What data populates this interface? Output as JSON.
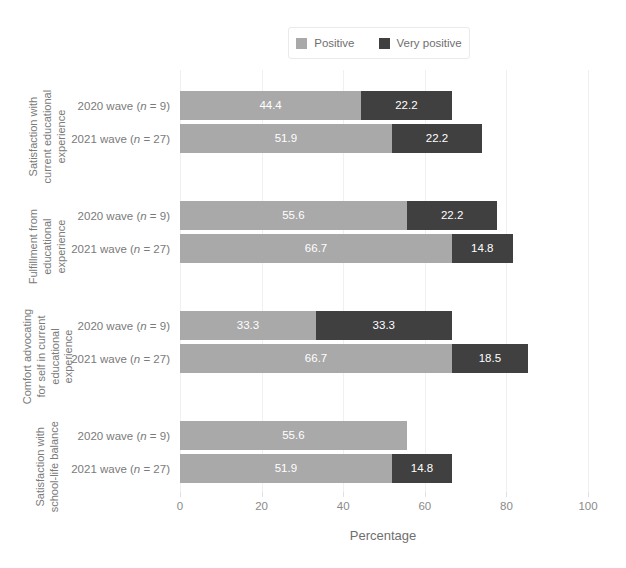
{
  "chart_data": {
    "type": "bar",
    "orientation": "horizontal",
    "stacked": true,
    "title": "",
    "xlabel": "Percentage",
    "ylabel": "",
    "xlim": [
      0,
      100
    ],
    "xticks": [
      0,
      20,
      40,
      60,
      80,
      100
    ],
    "grid": true,
    "legend_position": "top",
    "series": [
      {
        "name": "Positive",
        "color": "#a9a9a9"
      },
      {
        "name": "Very positive",
        "color": "#404040"
      }
    ],
    "groups": [
      {
        "label": "Satisfaction with current educational experience",
        "rows": [
          {
            "category": "2020 wave (n = 9)",
            "wave": "2020 wave",
            "n": 9,
            "values": [
              44.4,
              22.2
            ],
            "total": 66.6
          },
          {
            "category": "2021 wave (n = 27)",
            "wave": "2021 wave",
            "n": 27,
            "values": [
              51.9,
              22.2
            ],
            "total": 74.1
          }
        ]
      },
      {
        "label": "Fulfillment from educational experience",
        "rows": [
          {
            "category": "2020 wave (n = 9)",
            "wave": "2020 wave",
            "n": 9,
            "values": [
              55.6,
              22.2
            ],
            "total": 77.8
          },
          {
            "category": "2021 wave (n = 27)",
            "wave": "2021 wave",
            "n": 27,
            "values": [
              66.7,
              14.8
            ],
            "total": 81.5
          }
        ]
      },
      {
        "label": "Comfort advocating for self in current educational experience",
        "rows": [
          {
            "category": "2020 wave (n = 9)",
            "wave": "2020 wave",
            "n": 9,
            "values": [
              33.3,
              33.3
            ],
            "total": 66.6
          },
          {
            "category": "2021 wave (n = 27)",
            "wave": "2021 wave",
            "n": 27,
            "values": [
              66.7,
              18.5
            ],
            "total": 85.2
          }
        ]
      },
      {
        "label": "Satisfaction with school-life balance",
        "rows": [
          {
            "category": "2020 wave (n = 9)",
            "wave": "2020 wave",
            "n": 9,
            "values": [
              55.6,
              0
            ],
            "total": 55.6
          },
          {
            "category": "2021 wave (n = 27)",
            "wave": "2021 wave",
            "n": 27,
            "values": [
              51.9,
              14.8
            ],
            "total": 66.7
          }
        ]
      }
    ]
  },
  "legend": {
    "items": [
      {
        "label": "Positive",
        "color": "#a9a9a9"
      },
      {
        "label": "Very positive",
        "color": "#404040"
      }
    ]
  },
  "axis": {
    "title": "Percentage",
    "ticks": [
      "0",
      "20",
      "40",
      "60",
      "80",
      "100"
    ]
  }
}
